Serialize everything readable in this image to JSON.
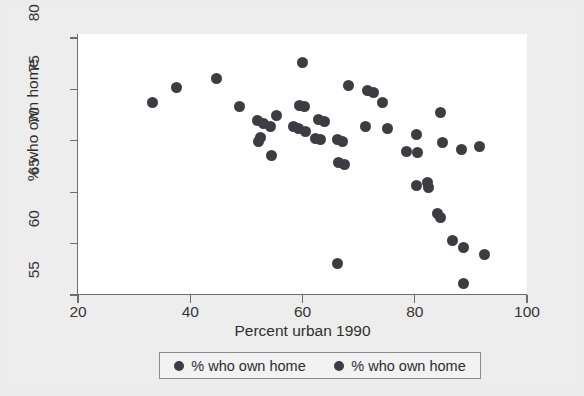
{
  "figure": {
    "background_color": "#ececec",
    "plot_background_color": "#ffffff",
    "marker_color": "#3c3c42",
    "axis_color": "#6d6d6d"
  },
  "chart_data": {
    "type": "scatter",
    "title": "",
    "xlabel": "Percent urban 1990",
    "ylabel": "% who own home",
    "xlim": [
      20,
      100
    ],
    "ylim": [
      55,
      80
    ],
    "xticks": [
      20,
      40,
      60,
      80,
      100
    ],
    "yticks": [
      55,
      60,
      65,
      70,
      75,
      80
    ],
    "xtick_labels": [
      "20",
      "40",
      "60",
      "80",
      "100"
    ],
    "ytick_labels": [
      "55",
      "60",
      "65",
      "70",
      "75",
      "80"
    ],
    "grid": false,
    "legend_position": "below-axis-center",
    "legend_entries": [
      "% who own home",
      "% who own home"
    ],
    "series": [
      {
        "name": "% who own home",
        "marker": "filled-circle",
        "points": [
          [
            33.2,
            73.7
          ],
          [
            37.5,
            75.2
          ],
          [
            44.6,
            76.1
          ],
          [
            48.8,
            73.3
          ],
          [
            52.0,
            72.0
          ],
          [
            54.3,
            71.4
          ],
          [
            53.0,
            71.7
          ],
          [
            52.5,
            70.3
          ],
          [
            52.2,
            69.9
          ],
          [
            54.5,
            68.6
          ],
          [
            55.4,
            72.5
          ],
          [
            59.4,
            73.4
          ],
          [
            60.4,
            73.3
          ],
          [
            60.0,
            77.6
          ],
          [
            60.6,
            70.9
          ],
          [
            58.4,
            71.4
          ],
          [
            59.3,
            71.2
          ],
          [
            62.9,
            72.1
          ],
          [
            63.9,
            71.9
          ],
          [
            62.4,
            70.2
          ],
          [
            63.2,
            70.1
          ],
          [
            66.3,
            70.1
          ],
          [
            67.2,
            69.9
          ],
          [
            66.4,
            67.9
          ],
          [
            67.4,
            67.7
          ],
          [
            66.3,
            58.1
          ],
          [
            71.6,
            74.9
          ],
          [
            72.7,
            74.7
          ],
          [
            68.2,
            75.4
          ],
          [
            71.2,
            71.4
          ],
          [
            75.2,
            71.2
          ],
          [
            74.2,
            73.7
          ],
          [
            80.3,
            70.6
          ],
          [
            78.5,
            69.0
          ],
          [
            80.5,
            68.9
          ],
          [
            80.3,
            65.7
          ],
          [
            82.2,
            65.9
          ],
          [
            82.4,
            65.5
          ],
          [
            84.1,
            62.9
          ],
          [
            84.5,
            62.5
          ],
          [
            86.8,
            60.3
          ],
          [
            88.7,
            59.6
          ],
          [
            88.6,
            56.1
          ],
          [
            84.9,
            69.8
          ],
          [
            84.6,
            72.8
          ],
          [
            88.4,
            69.2
          ],
          [
            92.5,
            58.9
          ],
          [
            91.6,
            69.4
          ]
        ]
      }
    ]
  },
  "axes": {
    "x_title": "Percent urban 1990",
    "y_title": "% who own home"
  }
}
